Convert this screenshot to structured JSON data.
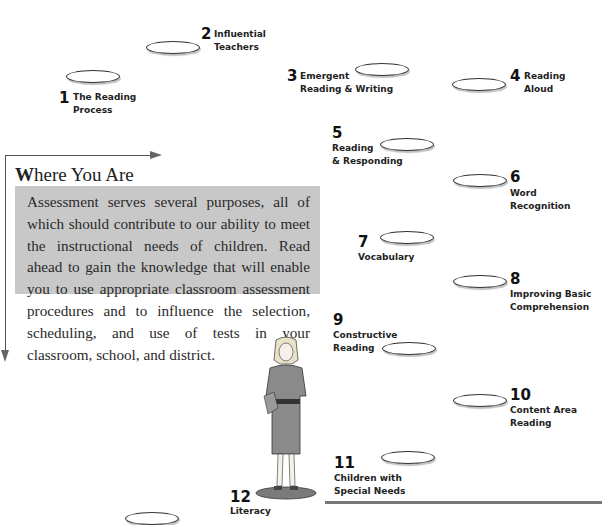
{
  "roadmap": {
    "stops": [
      {
        "number": "1",
        "label_line1": "The Reading",
        "label_line2": "Process"
      },
      {
        "number": "2",
        "label_line1": "Influential",
        "label_line2": "Teachers"
      },
      {
        "number": "3",
        "label_line1": "Emergent",
        "label_line2": "Reading & Writing"
      },
      {
        "number": "4",
        "label_line1": "Reading",
        "label_line2": "Aloud"
      },
      {
        "number": "5",
        "label_line1": "Reading",
        "label_line2": "& Responding"
      },
      {
        "number": "6",
        "label_line1": "Word",
        "label_line2": "Recognition"
      },
      {
        "number": "7",
        "label_line1": "Vocabulary",
        "label_line2": ""
      },
      {
        "number": "8",
        "label_line1": "Improving Basic",
        "label_line2": "Comprehension"
      },
      {
        "number": "9",
        "label_line1": "Constructive",
        "label_line2": "Reading"
      },
      {
        "number": "10",
        "label_line1": "Content Area",
        "label_line2": "Reading"
      },
      {
        "number": "11",
        "label_line1": "Children with",
        "label_line2": "Special Needs"
      },
      {
        "number": "12",
        "label_line1": "Literacy",
        "label_line2": ""
      }
    ]
  },
  "where_you_are": {
    "title_initial": "W",
    "title_rest": "here You Are",
    "body": "Assessment serves several purposes, all of which should contribute to our ability to meet the instructional needs of children. Read ahead to gain the knowledge that will enable you to use appropriate classroom assessment procedures and to influence the selection, scheduling, and use of tests in your classroom, school, and district."
  },
  "colors": {
    "box_background": "#c8c8c8",
    "text": "#222222",
    "frame": "#555555"
  }
}
